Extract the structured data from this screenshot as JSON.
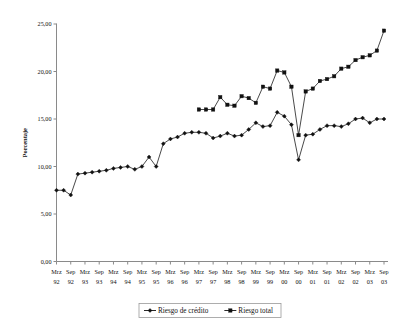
{
  "chart_data": {
    "type": "line",
    "title": "",
    "xlabel": "",
    "ylabel": "Porcentaje",
    "ylim": [
      0,
      25
    ],
    "ytick_step": 5,
    "ytick_labels": [
      "0,00",
      "5,00",
      "10,00",
      "15,00",
      "20,00",
      "25,00"
    ],
    "ytick_values": [
      0,
      5,
      10,
      15,
      20,
      25
    ],
    "grid": false,
    "legend_position": "bottom",
    "categories": [
      "Mrz 92",
      "Sep 92",
      "Mrz 93",
      "Sep 93",
      "Mrz 94",
      "Sep 94",
      "Mrz 95",
      "Sep 95",
      "Mrz 96",
      "Sep 96",
      "Mrz 97",
      "Sep 97",
      "Mrz 98",
      "Sep 98",
      "Mrz 99",
      "Sep 99",
      "Mrz 00",
      "Sep 00",
      "Mrz 01",
      "Sep 01",
      "Mrz 02",
      "Sep 02",
      "Mrz 03",
      "Sep 03"
    ],
    "xtick_months": [
      "Mrz",
      "Sep",
      "Mrz",
      "Sep",
      "Mrz",
      "Sep",
      "Mrz",
      "Sep",
      "Mrz",
      "Sep",
      "Mrz",
      "Sep",
      "Mrz",
      "Sep",
      "Mrz",
      "Sep",
      "Mrz",
      "Sep",
      "Mrz",
      "Sep",
      "Mrz",
      "Sep",
      "Mrz",
      "Sep"
    ],
    "xtick_years": [
      "92",
      "92",
      "93",
      "93",
      "94",
      "94",
      "95",
      "95",
      "96",
      "96",
      "97",
      "97",
      "98",
      "98",
      "99",
      "99",
      "00",
      "00",
      "01",
      "01",
      "02",
      "02",
      "03",
      "03"
    ],
    "series": [
      {
        "name": "Riesgo de crédito",
        "marker": "diamond",
        "color": "#111111",
        "x": [
          "Mrz 92",
          "Jun 92",
          "Sep 92",
          "Dic 92",
          "Mrz 93",
          "Jun 93",
          "Sep 93",
          "Dic 93",
          "Mrz 94",
          "Jun 94",
          "Sep 94",
          "Dic 94",
          "Mrz 95",
          "Jun 95",
          "Sep 95",
          "Dic 95",
          "Mrz 96",
          "Jun 96",
          "Sep 96",
          "Dic 96",
          "Mrz 97",
          "Jun 97",
          "Sep 97",
          "Dic 97",
          "Mrz 98",
          "Jun 98",
          "Sep 98",
          "Dic 98",
          "Mrz 99",
          "Jun 99",
          "Sep 99",
          "Dic 99",
          "Mrz 00",
          "Jun 00",
          "Sep 00",
          "Dic 00",
          "Mrz 01",
          "Jun 01",
          "Sep 01",
          "Dic 01",
          "Mrz 02",
          "Jun 02",
          "Sep 02",
          "Dic 02",
          "Mrz 03",
          "Jun 03",
          "Sep 03"
        ],
        "values": [
          7.5,
          7.5,
          7.0,
          9.2,
          9.3,
          9.4,
          9.5,
          9.6,
          9.8,
          9.9,
          10.0,
          9.7,
          10.0,
          11.0,
          10.0,
          12.4,
          12.9,
          13.1,
          13.5,
          13.6,
          13.6,
          13.5,
          13.0,
          13.2,
          13.5,
          13.2,
          13.3,
          13.9,
          14.6,
          14.2,
          14.3,
          15.7,
          15.3,
          14.4,
          10.7,
          13.3,
          13.4,
          13.9,
          14.3,
          14.3,
          14.2,
          14.5,
          15.0,
          15.1,
          14.6,
          15.0,
          15.0
        ]
      },
      {
        "name": "Riesgo total",
        "marker": "square",
        "color": "#111111",
        "x": [
          "Mrz 97",
          "Jun 97",
          "Sep 97",
          "Dic 97",
          "Mrz 98",
          "Jun 98",
          "Sep 98",
          "Dic 98",
          "Mrz 99",
          "Jun 99",
          "Sep 99",
          "Dic 99",
          "Mrz 00",
          "Jun 00",
          "Sep 00",
          "Dic 00",
          "Mrz 01",
          "Jun 01",
          "Sep 01",
          "Dic 01",
          "Mrz 02",
          "Jun 02",
          "Sep 02",
          "Dic 02",
          "Mrz 03",
          "Jun 03",
          "Sep 03"
        ],
        "values": [
          16.0,
          16.0,
          16.0,
          17.3,
          16.5,
          16.4,
          17.4,
          17.2,
          16.7,
          18.4,
          18.2,
          20.1,
          19.9,
          18.4,
          13.3,
          17.9,
          18.2,
          19.0,
          19.2,
          19.5,
          20.3,
          20.5,
          21.2,
          21.5,
          21.7,
          22.2,
          24.3
        ]
      }
    ]
  },
  "legend": {
    "items": [
      {
        "label": "Riesgo de crédito"
      },
      {
        "label": "Riesgo total"
      }
    ]
  }
}
